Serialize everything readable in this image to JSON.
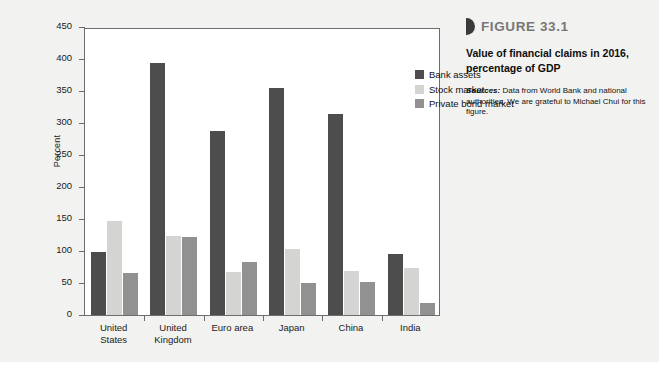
{
  "figure": {
    "marker_icon": "figure-marker-icon",
    "number_label": "FIGURE 33.1",
    "caption_title": "Value of financial claims in 2016, percentage of GDP",
    "source_label": "Sources:",
    "source_text": " Data from World Bank and national authorities. We are grateful to Michael Chui for this figure."
  },
  "chart_data": {
    "type": "bar",
    "title": "Value of financial claims in 2016, percentage of GDP",
    "xlabel": "",
    "ylabel": "Percent",
    "ylim": [
      0,
      450
    ],
    "yticks": [
      0,
      50,
      100,
      150,
      200,
      250,
      300,
      350,
      400,
      450
    ],
    "grid": false,
    "legend_position": "top-right inside plot",
    "categories": [
      "United States",
      "United Kingdom",
      "Euro area",
      "Japan",
      "China",
      "India"
    ],
    "category_lines": [
      [
        "United",
        "States"
      ],
      [
        "United",
        "Kingdom"
      ],
      [
        "Euro area"
      ],
      [
        "Japan"
      ],
      [
        "China"
      ],
      [
        "India"
      ]
    ],
    "series": [
      {
        "name": "Bank assets",
        "color": "#4d4d4d",
        "values": [
          98,
          393,
          288,
          355,
          314,
          95
        ]
      },
      {
        "name": "Stock market",
        "color": "#d4d4d2",
        "values": [
          147,
          124,
          67,
          103,
          68,
          73
        ]
      },
      {
        "name": "Private bond market",
        "color": "#919191",
        "values": [
          65,
          122,
          83,
          50,
          51,
          18
        ]
      }
    ]
  }
}
